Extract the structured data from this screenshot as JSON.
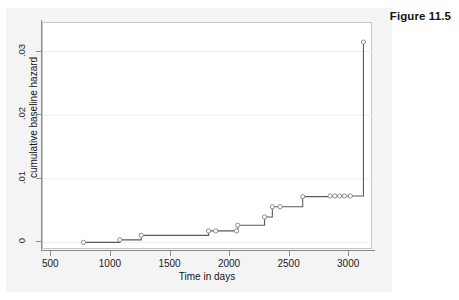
{
  "figure": {
    "caption": "Figure 11.5"
  },
  "chart_data": {
    "type": "line",
    "subtype": "step-function",
    "title": "",
    "xlabel": "Time in days",
    "ylabel": "cumulative baseline hazard",
    "xlim": [
      430,
      3200
    ],
    "ylim": [
      -0.0012,
      0.0345
    ],
    "xticks": [
      500,
      1000,
      1500,
      2000,
      2500,
      3000
    ],
    "xticklabels": [
      "500",
      "1000",
      "1500",
      "2000",
      "2500",
      "3000"
    ],
    "yticks": [
      0,
      0.01,
      0.02,
      0.03
    ],
    "yticklabels": [
      "0",
      ".01",
      ".02",
      ".03"
    ],
    "grid": "horizontal",
    "legend": "none",
    "line_color": "#5a5a5a",
    "marker_color": "#8c8c8c",
    "marker_shape": "circle-open",
    "series": [
      {
        "name": "cumulative baseline hazard",
        "x": [
          770,
          1075,
          1255,
          1820,
          1880,
          2055,
          2065,
          2290,
          2355,
          2420,
          2610,
          2840,
          2880,
          2920,
          2960,
          3010,
          3120
        ],
        "y": [
          0.0,
          0.0004,
          0.0011,
          0.0018,
          0.0018,
          0.0018,
          0.0027,
          0.004,
          0.0056,
          0.0056,
          0.0072,
          0.0073,
          0.0073,
          0.0073,
          0.0073,
          0.0073,
          0.0315
        ]
      }
    ],
    "steps": [
      {
        "t": 770,
        "h": 0.0
      },
      {
        "t": 1075,
        "h": 0.0004
      },
      {
        "t": 1255,
        "h": 0.0011
      },
      {
        "t": 1820,
        "h": 0.0018
      },
      {
        "t": 1880,
        "h": 0.0018
      },
      {
        "t": 2055,
        "h": 0.0018
      },
      {
        "t": 2065,
        "h": 0.0027
      },
      {
        "t": 2290,
        "h": 0.004
      },
      {
        "t": 2355,
        "h": 0.0056
      },
      {
        "t": 2420,
        "h": 0.0056
      },
      {
        "t": 2610,
        "h": 0.0072
      },
      {
        "t": 2840,
        "h": 0.0073
      },
      {
        "t": 2880,
        "h": 0.0073
      },
      {
        "t": 2920,
        "h": 0.0073
      },
      {
        "t": 2960,
        "h": 0.0073
      },
      {
        "t": 3010,
        "h": 0.0073
      },
      {
        "t": 3120,
        "h": 0.0315
      }
    ]
  }
}
